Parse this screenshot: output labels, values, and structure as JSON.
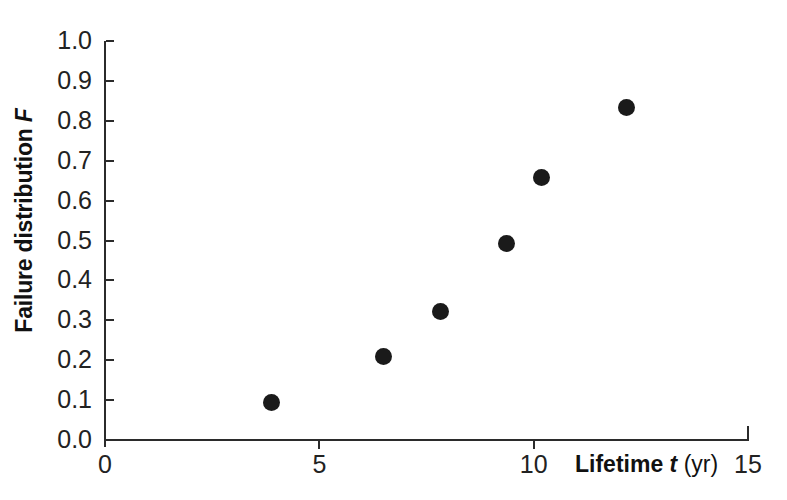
{
  "chart_data": {
    "type": "scatter",
    "title": "",
    "subtitle": "",
    "xlabel": "Lifetime t (yr)",
    "ylabel": "Failure distribution F",
    "xlabel_parts": {
      "bold": "Lifetime",
      "bold_italic": "t",
      "regular": "(yr)"
    },
    "ylabel_parts": {
      "bold": "Failure distribution",
      "bold_italic": "F"
    },
    "xlim": [
      0,
      15
    ],
    "ylim": [
      0.0,
      1.0
    ],
    "xticks": [
      0,
      5,
      10,
      15
    ],
    "xtick_labels": [
      "0",
      "5",
      "10",
      "15"
    ],
    "yticks": [
      0.0,
      0.1,
      0.2,
      0.3,
      0.4,
      0.5,
      0.6,
      0.7,
      0.8,
      0.9,
      1.0
    ],
    "ytick_labels": [
      "0.0",
      "0.1",
      "0.2",
      "0.3",
      "0.4",
      "0.5",
      "0.6",
      "0.7",
      "0.8",
      "0.9",
      "1.0"
    ],
    "grid": false,
    "legend": false,
    "legend_position": "none",
    "marker_color": "#1a1a1a",
    "marker_shape": "filled-circle",
    "axis_color": "#2b2b2b",
    "background_color": "#ffffff",
    "series": [
      {
        "name": "Failure distribution",
        "x": [
          3.88,
          6.5,
          7.83,
          9.37,
          10.19,
          12.17
        ],
        "y": [
          0.093,
          0.209,
          0.321,
          0.492,
          0.659,
          0.834
        ]
      }
    ],
    "points": [
      {
        "t": 3.88,
        "F": 0.093
      },
      {
        "t": 6.5,
        "F": 0.209
      },
      {
        "t": 7.83,
        "F": 0.321
      },
      {
        "t": 9.37,
        "F": 0.492
      },
      {
        "t": 10.19,
        "F": 0.659
      },
      {
        "t": 12.17,
        "F": 0.834
      }
    ]
  }
}
